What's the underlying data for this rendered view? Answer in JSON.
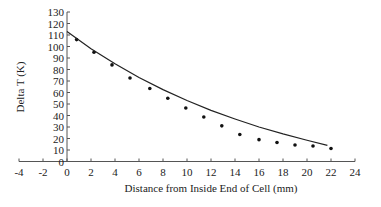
{
  "chart_data": {
    "type": "scatter",
    "title": "",
    "xlabel": "Distance from Inside End of Cell (mm)",
    "ylabel": "Delta T (K)",
    "xlim": [
      -4,
      24
    ],
    "ylim": [
      0,
      130
    ],
    "x_ticks": [
      -4,
      -2,
      0,
      2,
      4,
      6,
      8,
      10,
      12,
      14,
      16,
      18,
      20,
      22,
      24
    ],
    "y_ticks": [
      0,
      10,
      20,
      30,
      40,
      50,
      60,
      70,
      80,
      90,
      100,
      110,
      120,
      130
    ],
    "grid": false,
    "legend": null,
    "series": [
      {
        "name": "Measured",
        "style": "points",
        "x": [
          0.8,
          2.25,
          3.75,
          5.25,
          6.9,
          8.4,
          9.9,
          11.4,
          12.9,
          14.4,
          16.0,
          17.5,
          19.0,
          20.5,
          22.0
        ],
        "y": [
          106,
          95,
          84,
          72.6,
          63.5,
          55,
          46.5,
          38.7,
          31,
          23.5,
          19,
          16.5,
          14.3,
          13.5,
          11.3
        ]
      },
      {
        "name": "Model",
        "style": "line",
        "x": [
          0,
          2,
          4,
          6,
          8,
          10,
          12,
          14,
          16,
          18,
          20,
          21.7
        ],
        "y": [
          113,
          98,
          85,
          73,
          62.5,
          53,
          44.5,
          37,
          30,
          24,
          18.5,
          14
        ]
      }
    ]
  }
}
